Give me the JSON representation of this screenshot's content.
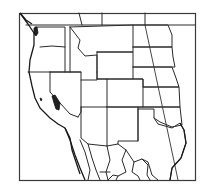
{
  "map": {
    "type": "line-map",
    "region": "Western United States",
    "style": "black outline, white fill",
    "colors": {
      "line": "#2a2a2a",
      "background": "#ffffff",
      "water": "#222222"
    },
    "features": [
      "state-boundaries",
      "coastline",
      "international-border-mexico",
      "international-border-canada",
      "puget-sound",
      "lake-tahoe-region",
      "diagonal-meridian-line",
      "frame"
    ]
  }
}
